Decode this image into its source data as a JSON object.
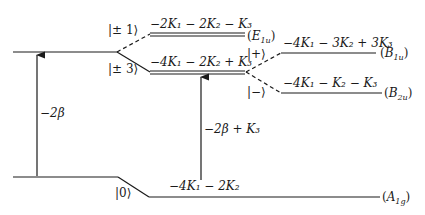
{
  "diagram": {
    "type": "energy-level-diagram",
    "colors": {
      "ink": "#1a1a1a",
      "background": "#ffffff"
    },
    "left_levels": [
      {
        "id": "upper",
        "y": 52
      },
      {
        "id": "lower",
        "y": 177
      }
    ],
    "kets": {
      "pm1": "|± 1⟩",
      "pm3": "|± 3⟩",
      "plus": "|+⟩",
      "minus": "|−⟩",
      "zero": "|0⟩"
    },
    "levels": {
      "E1u": {
        "energy": "−2K₁ − 2K₂ − K₃",
        "symmetry": "E",
        "sym_sub": "1u"
      },
      "pm3": {
        "energy": "−4K₁ − 2K₂ + K₃"
      },
      "B1u": {
        "energy": "−4K₁ − 3K₂ + 3K₃",
        "symmetry": "B",
        "sym_sub": "1u"
      },
      "B2u": {
        "energy": "−4K₁ − K₂ − K₃",
        "symmetry": "B",
        "sym_sub": "2u"
      },
      "A1g": {
        "energy": "−4K₁ − 2K₂",
        "symmetry": "A",
        "sym_sub": "1g"
      }
    },
    "arrows": {
      "left": {
        "label": "−2β"
      },
      "right": {
        "label": "−2β + K₃"
      }
    }
  }
}
